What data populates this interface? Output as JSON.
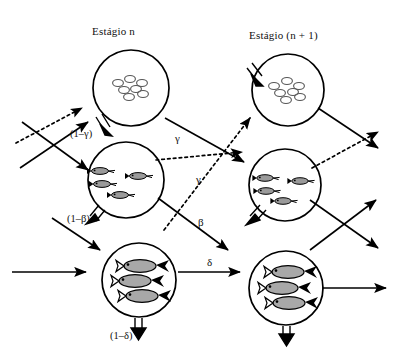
{
  "figure": {
    "kind": "life-cycle-flow-diagram",
    "background_color": "#ffffff",
    "ink_color": "#000000"
  },
  "headers": {
    "left": "Estágio n",
    "right": "Estágio (n + 1)"
  },
  "stages": [
    {
      "id": "eggs-left",
      "column": "Estágio n",
      "row": "eggs",
      "content_icon": "eggs-cluster-icon",
      "count": 7,
      "cx": 131,
      "cy": 88,
      "r": 38
    },
    {
      "id": "larvae-left",
      "column": "Estágio n",
      "row": "larvae",
      "content_icon": "small-fish-cluster-icon",
      "count": 4,
      "cx": 126,
      "cy": 180,
      "r": 38
    },
    {
      "id": "adults-left",
      "column": "Estágio n",
      "row": "adults",
      "content_icon": "large-fish-cluster-icon",
      "count": 3,
      "cx": 139,
      "cy": 280,
      "r": 37
    },
    {
      "id": "eggs-right",
      "column": "Estágio (n + 1)",
      "row": "eggs",
      "content_icon": "eggs-cluster-icon",
      "count": 7,
      "cx": 288,
      "cy": 90,
      "r": 36
    },
    {
      "id": "larvae-right",
      "column": "Estágio (n + 1)",
      "row": "larvae",
      "content_icon": "small-fish-cluster-icon",
      "count": 4,
      "cx": 285,
      "cy": 185,
      "r": 36
    },
    {
      "id": "adults-right",
      "column": "Estágio (n + 1)",
      "row": "adults",
      "content_icon": "large-fish-cluster-icon",
      "count": 3,
      "cx": 286,
      "cy": 288,
      "r": 37
    }
  ],
  "rate_labels": [
    {
      "id": "one-minus-gamma",
      "text": "(1–γ)",
      "x": 70,
      "y": 128,
      "style": "paren",
      "attached_to": "eggs-left → larvae-left"
    },
    {
      "id": "one-minus-beta",
      "text": "(1–β)",
      "x": 67,
      "y": 213,
      "style": "paren",
      "attached_to": "larvae-left → adults-left"
    },
    {
      "id": "one-minus-delta",
      "text": "(1–δ)",
      "x": 110,
      "y": 330,
      "style": "paren",
      "attached_to": "adults-left → out"
    },
    {
      "id": "gamma-upper",
      "text": "γ",
      "x": 175,
      "y": 137,
      "style": "greek",
      "attached_to": "dotted emigration from larvae-left"
    },
    {
      "id": "gamma-lower",
      "text": "γ",
      "x": 196,
      "y": 178,
      "style": "greek",
      "attached_to": "dotted immigration to eggs-right"
    },
    {
      "id": "beta",
      "text": "β",
      "x": 198,
      "y": 222,
      "style": "greek",
      "attached_to": "larvae-left → out"
    },
    {
      "id": "delta",
      "text": "δ",
      "x": 207,
      "y": 262,
      "style": "greek",
      "attached_to": "adults-left → adults-right"
    }
  ],
  "transitions": [
    {
      "id": "t-eggs-to-larvae-left",
      "from": "eggs-left",
      "to": "larvae-left",
      "line": "double",
      "label": "(1–γ)"
    },
    {
      "id": "t-larvae-to-adults-left",
      "from": "larvae-left",
      "to": "adults-left",
      "line": "double",
      "label": "(1–β)"
    },
    {
      "id": "t-adults-out-left",
      "from": "adults-left",
      "to": "exit",
      "line": "double",
      "label": "(1–δ)"
    },
    {
      "id": "t-eggs-to-larvae-right",
      "from": "eggs-right",
      "to": "larvae-right",
      "line": "double",
      "label": ""
    },
    {
      "id": "t-larvae-to-adults-right",
      "from": "larvae-right",
      "to": "adults-right",
      "line": "double",
      "label": ""
    },
    {
      "id": "t-adults-out-right",
      "from": "adults-right",
      "to": "exit",
      "line": "double",
      "label": ""
    },
    {
      "id": "t-delta",
      "from": "adults-left",
      "to": "adults-right",
      "line": "solid",
      "label": "δ"
    },
    {
      "id": "t-beta",
      "from": "larvae-left",
      "to": "outflow",
      "line": "solid",
      "label": "β"
    },
    {
      "id": "t-gamma-upper",
      "from": "larvae-left",
      "to": "outflow",
      "line": "dotted",
      "label": "γ"
    },
    {
      "id": "t-gamma-lower",
      "from": "offstage",
      "to": "eggs-right",
      "line": "dotted",
      "label": "γ"
    }
  ]
}
